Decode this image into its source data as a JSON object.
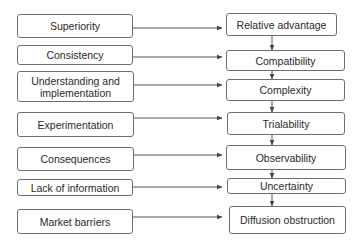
{
  "diagram": {
    "type": "flow",
    "left_column": {
      "label": "barriers / factors",
      "items": [
        {
          "id": "superiority",
          "label": "Superiority"
        },
        {
          "id": "consistency",
          "label": "Consistency"
        },
        {
          "id": "understanding",
          "label": "Understanding and implementation"
        },
        {
          "id": "experimentation",
          "label": "Experimentation"
        },
        {
          "id": "consequences",
          "label": "Consequences"
        },
        {
          "id": "lack-of-information",
          "label": "Lack of information"
        },
        {
          "id": "market-barriers",
          "label": "Market barriers"
        }
      ]
    },
    "right_column": {
      "label": "innovation attributes",
      "items": [
        {
          "id": "relative-advantage",
          "label": "Relative advantage"
        },
        {
          "id": "compatibility",
          "label": "Compatibility"
        },
        {
          "id": "complexity",
          "label": "Complexity"
        },
        {
          "id": "trialability",
          "label": "Trialability"
        },
        {
          "id": "observability",
          "label": "Observability"
        },
        {
          "id": "uncertainty",
          "label": "Uncertainty"
        },
        {
          "id": "diffusion-obstruction",
          "label": "Diffusion obstruction"
        }
      ]
    },
    "edges": [
      {
        "from": "superiority",
        "to": "relative-advantage"
      },
      {
        "from": "consistency",
        "to": "compatibility"
      },
      {
        "from": "understanding",
        "to": "complexity"
      },
      {
        "from": "experimentation",
        "to": "trialability"
      },
      {
        "from": "consequences",
        "to": "observability"
      },
      {
        "from": "lack-of-information",
        "to": "uncertainty"
      },
      {
        "from": "market-barriers",
        "to": "diffusion-obstruction"
      },
      {
        "from": "relative-advantage",
        "to": "compatibility"
      },
      {
        "from": "compatibility",
        "to": "complexity"
      },
      {
        "from": "complexity",
        "to": "trialability"
      },
      {
        "from": "trialability",
        "to": "observability"
      },
      {
        "from": "observability",
        "to": "uncertainty"
      },
      {
        "from": "uncertainty",
        "to": "diffusion-obstruction"
      }
    ],
    "colors": {
      "border": "#6e6e6e",
      "line": "#555555",
      "text": "#2a2a2a",
      "background": "#ffffff"
    }
  }
}
